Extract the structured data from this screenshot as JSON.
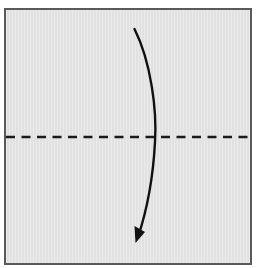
{
  "diagram": {
    "title": "Valley fold in half (fold top edge down to bottom edge)",
    "paper": {
      "shape": "square",
      "fill_color": "#e6e6e6",
      "border_color": "#5a5a5a"
    },
    "fold_line": {
      "type": "valley-fold",
      "style": "dashed",
      "orientation": "horizontal",
      "position": "middle",
      "color": "#1a1a1a"
    },
    "arrow": {
      "type": "fold-direction-arrow",
      "direction": "down",
      "description": "Curved arrow from top area, crossing the fold line, pointing downward",
      "color": "#111111"
    }
  }
}
